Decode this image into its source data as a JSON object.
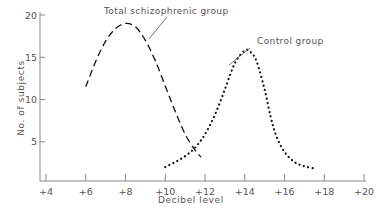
{
  "chart_data": {
    "type": "line",
    "title": "",
    "xlabel": "Decibel level",
    "ylabel": "No. of subjects",
    "xlim": [
      4,
      20
    ],
    "ylim": [
      0,
      20
    ],
    "x_ticks": [
      "+4",
      "+6",
      "+8",
      "+10",
      "+12",
      "+14",
      "+16",
      "+18",
      "+20"
    ],
    "y_ticks": [
      "5",
      "10",
      "15",
      "20"
    ],
    "grid": false,
    "legend": "none (curves labeled by annotations with arrows)",
    "series": [
      {
        "name": "Total schizophrenic group",
        "style": "dashed",
        "x": [
          6.0,
          6.5,
          7.0,
          7.5,
          8.0,
          8.5,
          9.0,
          9.5,
          10.0,
          10.5,
          11.0,
          11.5,
          11.8
        ],
        "y": [
          11.5,
          14.5,
          16.9,
          18.4,
          19.0,
          18.6,
          17.0,
          14.6,
          11.6,
          8.6,
          5.9,
          4.0,
          3.2
        ]
      },
      {
        "name": "Control group",
        "style": "dotted",
        "x": [
          10.0,
          10.5,
          11.0,
          11.5,
          12.0,
          12.5,
          13.0,
          13.5,
          14.0,
          14.3,
          14.6,
          15.0,
          15.3,
          15.6,
          16.0,
          16.5,
          17.0,
          17.6
        ],
        "y": [
          2.0,
          2.6,
          3.3,
          4.3,
          5.9,
          8.2,
          11.2,
          14.3,
          15.8,
          15.6,
          14.5,
          11.2,
          8.0,
          5.6,
          3.8,
          2.6,
          2.1,
          1.8
        ]
      }
    ],
    "annotations": [
      {
        "text": "Total schizophrenic group",
        "points_to_series": "Total schizophrenic group"
      },
      {
        "text": "Control group",
        "points_to_series": "Control group"
      }
    ]
  },
  "axis_color": "#888888",
  "line_color": "#111111"
}
